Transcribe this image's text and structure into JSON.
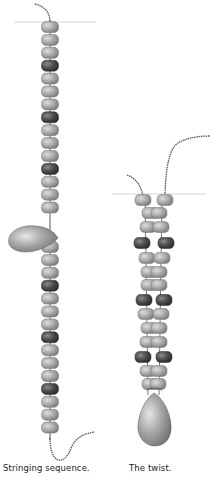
{
  "figures": [
    {
      "id": "stringing-sequence",
      "caption": "Stringing sequence.",
      "pattern": [
        "light",
        "light",
        "light",
        "dark"
      ],
      "beads_above_drop": 15,
      "beads_below_drop": 15
    },
    {
      "id": "the-twist",
      "caption": "The twist.",
      "pattern": [
        "light",
        "light",
        "light",
        "dark"
      ],
      "columns": 2
    }
  ],
  "colors": {
    "bead_light": "#a9aaa9",
    "bead_light_highlight": "#d4d5d4",
    "bead_dark": "#4a4b4a",
    "bead_dark_highlight": "#7a7b7a",
    "drop": "#9a9b9a",
    "drop_highlight": "#dcdcdc",
    "thread": "#555555",
    "guide_line": "#d6d6d6"
  }
}
